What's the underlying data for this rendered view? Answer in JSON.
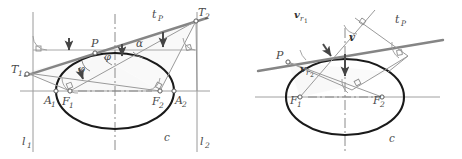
{
  "figure": {
    "kind": "geometry-diagram-pair",
    "colors": {
      "curve": "#1a1a1a",
      "line": "#6b6b6b",
      "thick_line": "#808080",
      "thin_line": "#999999",
      "axis": "#8c8c8c",
      "label": "#4a4a4a",
      "fill": "#f2f2f2"
    }
  },
  "left_diagram": {
    "name": "ellipse-reflection-property",
    "labels": {
      "point_p": "P",
      "tangent": "t",
      "tangent_sub": "P",
      "focus1": "F",
      "focus1_sub": "1",
      "focus2": "F",
      "focus2_sub": "2",
      "vertex1": "A",
      "vertex1_sub": "1",
      "vertex2": "A",
      "vertex2_sub": "2",
      "tangentpoint1": "T",
      "tangentpoint1_sub": "1",
      "tangentpoint2": "T",
      "tangentpoint2_sub": "2",
      "directrix1": "l",
      "directrix1_sub": "1",
      "directrix2": "l",
      "directrix2_sub": "2",
      "curve": "c",
      "angle_phi_left": "φ",
      "angle_phi_right": "φ",
      "angle_alpha": "α"
    }
  },
  "right_diagram": {
    "name": "ellipse-velocity-decomposition",
    "labels": {
      "point_p": "P",
      "tangent": "t",
      "tangent_sub": "P",
      "focus1": "F",
      "focus1_sub": "1",
      "focus2": "F",
      "focus2_sub": "2",
      "curve": "c",
      "velocity": "v",
      "radial1": "v",
      "radial1_sub": "r",
      "radial1_sub2": "1",
      "radial2": "v",
      "radial2_sub": "r",
      "radial2_sub2": "2"
    }
  }
}
